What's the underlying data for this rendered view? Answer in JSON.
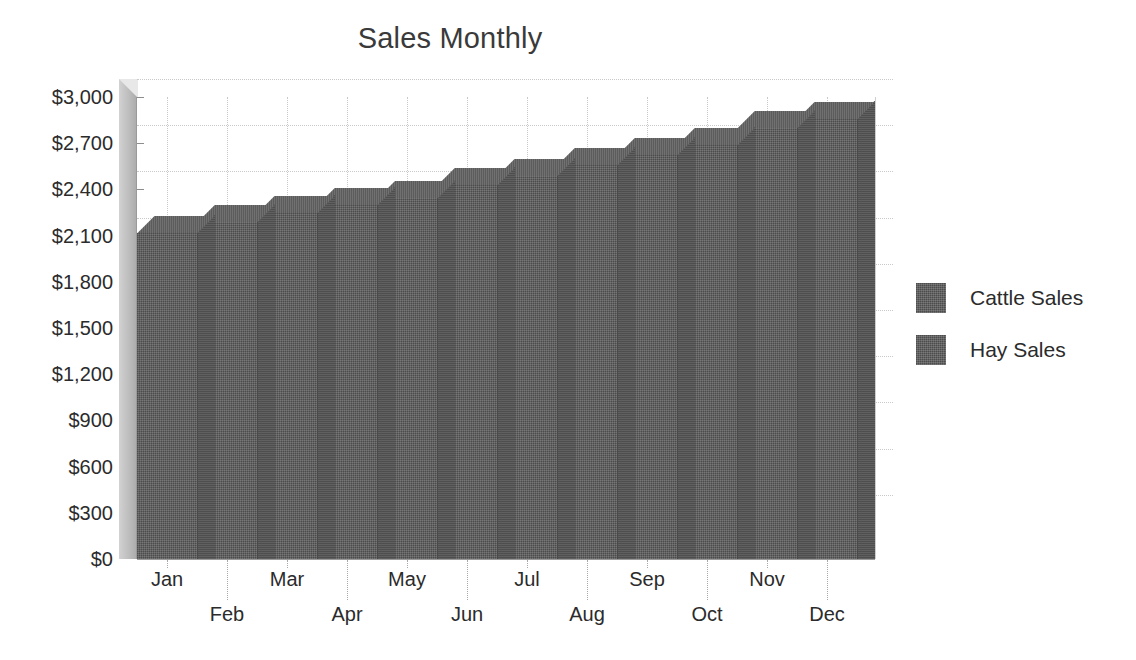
{
  "chart_data": {
    "type": "bar",
    "title": "Sales Monthly",
    "subtitle": "",
    "xlabel": "",
    "ylabel": "",
    "ylim": [
      0,
      3000
    ],
    "ytick_values": [
      0,
      300,
      600,
      900,
      1200,
      1500,
      1800,
      2100,
      2400,
      2700,
      3000
    ],
    "ytick_labels": [
      "$0",
      "$300",
      "$600",
      "$900",
      "$1,200",
      "$1,500",
      "$1,800",
      "$2,100",
      "$2,400",
      "$2,700",
      "$3,000"
    ],
    "categories": [
      "Jan",
      "Feb",
      "Mar",
      "Apr",
      "May",
      "Jun",
      "Jul",
      "Aug",
      "Sep",
      "Oct",
      "Nov",
      "Dec"
    ],
    "stacked": true,
    "three_d": true,
    "grid": {
      "horizontal": true,
      "vertical": true,
      "style": "dotted",
      "color": "#c9c9c9"
    },
    "legend": {
      "position": "right",
      "entries": [
        "Cattle Sales",
        "Hay Sales"
      ]
    },
    "series": [
      {
        "name": "Cattle Sales",
        "color": "#5a5a5a",
        "values": [
          1500,
          1550,
          1590,
          1620,
          1650,
          1710,
          1750,
          1800,
          1845,
          1890,
          1965,
          2010
        ]
      },
      {
        "name": "Hay Sales",
        "color": "#5a5a5a",
        "values": [
          620,
          640,
          660,
          680,
          695,
          720,
          740,
          760,
          780,
          800,
          835,
          850
        ]
      }
    ],
    "totals": [
      2120,
      2190,
      2250,
      2300,
      2345,
      2430,
      2490,
      2560,
      2625,
      2690,
      2800,
      2860
    ]
  },
  "legend": {
    "items": [
      {
        "label": "Cattle Sales",
        "color": "#5a5a5a"
      },
      {
        "label": "Hay Sales",
        "color": "#5a5a5a"
      }
    ]
  },
  "colors": {
    "bar_front": "#5a5a5a",
    "bar_top": "#686868",
    "bar_side": "#4e4e4e",
    "grid": "#c9c9c9",
    "axis": "#9a9a9a",
    "text": "#2b2b2b",
    "title": "#3a3a3a",
    "background": "#ffffff",
    "wall": "#bdbdbd"
  }
}
